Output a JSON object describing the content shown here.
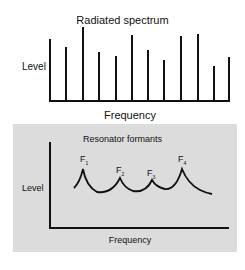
{
  "top_diagram": {
    "title": "Radiated spectrum",
    "ylabel": "Level",
    "xlabel": "Frequency"
  },
  "bottom_diagram": {
    "title": "Resonator formants",
    "ylabel": "Level",
    "xlabel": "Frequency",
    "formants": [
      {
        "label": "F",
        "sub": "1"
      },
      {
        "label": "F",
        "sub": "2"
      },
      {
        "label": "F",
        "sub": "3"
      },
      {
        "label": "F",
        "sub": "4"
      }
    ]
  },
  "colors": {
    "panel_bg": "#dcdcdc",
    "line": "#111111"
  }
}
